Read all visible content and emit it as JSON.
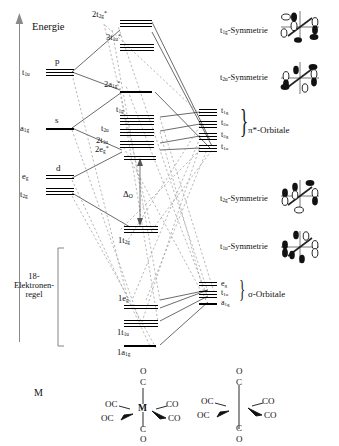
{
  "figure": {
    "axis_label": "Energie",
    "rule_label_line1": "18-",
    "rule_label_line2": "Elektronen-",
    "rule_label_line3": "regel",
    "splitting_label": "Δ",
    "splitting_sub": "O",
    "metal_label": "M"
  },
  "metal_levels": [
    {
      "term": "t",
      "sub": "1u",
      "star": "",
      "ao": "p"
    },
    {
      "term": "a",
      "sub": "1g",
      "star": "",
      "ao": "s"
    },
    {
      "term": "e",
      "sub": "g",
      "star": "",
      "ao": "d"
    },
    {
      "term": "t",
      "sub": "2g",
      "star": "",
      "ao": ""
    }
  ],
  "mo_levels": [
    {
      "pre": "2",
      "term": "t",
      "sub": "2g",
      "star": "*"
    },
    {
      "pre": "3",
      "term": "t",
      "sub": "1u",
      "star": "*"
    },
    {
      "pre": "2",
      "term": "a",
      "sub": "1g",
      "star": "*"
    },
    {
      "pre": "",
      "term": "t",
      "sub": "1g",
      "star": ""
    },
    {
      "pre": "",
      "term": "t",
      "sub": "2u",
      "star": ""
    },
    {
      "pre": "2",
      "term": "t",
      "sub": "1u",
      "star": ""
    },
    {
      "pre": "2",
      "term": "e",
      "sub": "g",
      "star": "*"
    },
    {
      "pre": "1",
      "term": "t",
      "sub": "2g",
      "star": ""
    },
    {
      "pre": "1",
      "term": "e",
      "sub": "g",
      "star": ""
    },
    {
      "pre": "1",
      "term": "t",
      "sub": "1u",
      "star": ""
    },
    {
      "pre": "1",
      "term": "a",
      "sub": "1g",
      "star": ""
    }
  ],
  "ligand_groups": [
    {
      "name": "π*-Orbitale",
      "levels": [
        {
          "term": "t",
          "sub": "1g"
        },
        {
          "term": "t",
          "sub": "2u"
        },
        {
          "term": "t",
          "sub": "2g"
        },
        {
          "term": "t",
          "sub": "1u"
        }
      ]
    },
    {
      "name": "σ-Orbitale",
      "levels": [
        {
          "term": "e",
          "sub": "g"
        },
        {
          "term": "t",
          "sub": "1u"
        },
        {
          "term": "a",
          "sub": "1g"
        }
      ]
    }
  ],
  "symmetry_panels": [
    {
      "term": "t",
      "sub": "1g",
      "suffix": "-Symmetrie"
    },
    {
      "term": "t",
      "sub": "2u",
      "suffix": "-Symmetrie"
    },
    {
      "term": "t",
      "sub": "2g",
      "suffix": "-Symmetrie"
    },
    {
      "term": "t",
      "sub": "1u",
      "suffix": "-Symmetrie"
    }
  ],
  "structures": [
    {
      "center": "M",
      "top": "O",
      "top2": "C",
      "bottom": "C",
      "bottom2": "O",
      "left_up": "OC",
      "left_down": "OC",
      "right_up": "CO",
      "right_down": "CO"
    },
    {
      "center": "",
      "top": "O",
      "top2": "C",
      "bottom": "C",
      "bottom2": "O",
      "left_up": "OC",
      "left_down": "OC",
      "right_up": "CO",
      "right_down": "CO"
    }
  ],
  "colors": {
    "ink": "#111111",
    "axis": "#8a8a8a",
    "dashed": "#9a9a9a",
    "solid": "#2b2b2b"
  }
}
